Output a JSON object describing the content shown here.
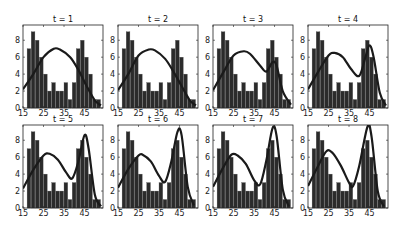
{
  "figure": {
    "layout": {
      "rows": 2,
      "cols": 4
    },
    "panels_pos": {
      "x0": [
        23,
        118,
        213,
        308
      ],
      "y0": [
        25,
        125
      ],
      "w": 80,
      "h": 83
    }
  },
  "chart_data": {
    "type": "bar",
    "xlim": [
      15,
      54
    ],
    "ylim": [
      0,
      9.8
    ],
    "xticks": [
      15,
      25,
      35,
      45
    ],
    "yticks": [
      0,
      2,
      4,
      6,
      8
    ],
    "histogram": {
      "bin_edges": [
        17,
        19,
        21,
        23,
        25,
        27,
        29,
        31,
        33,
        35,
        37,
        39,
        41,
        43,
        45,
        47,
        49,
        51,
        53
      ],
      "counts": [
        7,
        9,
        8,
        6,
        4,
        2,
        3,
        2,
        2,
        3,
        1,
        3,
        7,
        8,
        6,
        4,
        1,
        1
      ]
    },
    "panels": [
      {
        "title": "t = 1",
        "curve": [
          [
            15,
            2.2
          ],
          [
            20,
            4
          ],
          [
            25,
            6
          ],
          [
            30,
            7
          ],
          [
            33,
            6.9
          ],
          [
            38,
            6
          ],
          [
            42,
            4.5
          ],
          [
            46,
            2.6
          ],
          [
            50,
            0.9
          ],
          [
            53,
            0.3
          ]
        ]
      },
      {
        "title": "t = 2",
        "curve": [
          [
            15,
            2.1
          ],
          [
            20,
            4
          ],
          [
            25,
            6.2
          ],
          [
            30,
            6.9
          ],
          [
            33,
            6.8
          ],
          [
            38,
            5.8
          ],
          [
            42,
            4.3
          ],
          [
            46,
            2.6
          ],
          [
            50,
            0.9
          ],
          [
            53,
            0.3
          ]
        ]
      },
      {
        "title": "t = 3",
        "curve": [
          [
            15,
            2.1
          ],
          [
            20,
            4.2
          ],
          [
            25,
            6.2
          ],
          [
            30,
            6.7
          ],
          [
            33,
            6.4
          ],
          [
            38,
            5
          ],
          [
            41,
            4.3
          ],
          [
            44,
            5.4
          ],
          [
            46,
            5
          ],
          [
            49,
            2
          ],
          [
            53,
            0.4
          ]
        ]
      },
      {
        "title": "t = 4",
        "curve": [
          [
            15,
            2.2
          ],
          [
            20,
            4.3
          ],
          [
            25,
            6.2
          ],
          [
            28,
            6.5
          ],
          [
            32,
            6
          ],
          [
            36,
            4.6
          ],
          [
            40,
            3.8
          ],
          [
            43,
            6
          ],
          [
            45,
            7.4
          ],
          [
            47,
            6
          ],
          [
            50,
            1.8
          ],
          [
            53,
            0.3
          ]
        ]
      },
      {
        "title": "t = 5",
        "curve": [
          [
            15,
            2.3
          ],
          [
            20,
            4.5
          ],
          [
            25,
            6.2
          ],
          [
            28,
            6.4
          ],
          [
            32,
            5.7
          ],
          [
            36,
            4.2
          ],
          [
            39,
            3.5
          ],
          [
            42,
            5.5
          ],
          [
            45,
            8.6
          ],
          [
            47,
            7
          ],
          [
            50,
            1.6
          ],
          [
            53,
            0.2
          ]
        ]
      },
      {
        "title": "t = 6",
        "curve": [
          [
            15,
            2.4
          ],
          [
            20,
            4.6
          ],
          [
            25,
            6.2
          ],
          [
            27,
            6.3
          ],
          [
            31,
            5.5
          ],
          [
            35,
            3.8
          ],
          [
            38,
            3.1
          ],
          [
            41,
            5.5
          ],
          [
            44,
            9
          ],
          [
            46,
            8.6
          ],
          [
            49,
            2.5
          ],
          [
            52,
            0.3
          ]
        ]
      },
      {
        "title": "t = 7",
        "curve": [
          [
            15,
            2.5
          ],
          [
            20,
            4.8
          ],
          [
            24,
            6.3
          ],
          [
            27,
            6.2
          ],
          [
            31,
            5.2
          ],
          [
            35,
            3.3
          ],
          [
            38,
            2.8
          ],
          [
            41,
            5.6
          ],
          [
            44,
            9.4
          ],
          [
            46,
            8.5
          ],
          [
            49,
            2.2
          ],
          [
            52,
            0.2
          ]
        ]
      },
      {
        "title": "t = 8",
        "curve": [
          [
            15,
            2.6
          ],
          [
            20,
            5
          ],
          [
            24,
            6.7
          ],
          [
            27,
            6.5
          ],
          [
            31,
            5
          ],
          [
            35,
            3
          ],
          [
            37,
            2.6
          ],
          [
            40,
            5
          ],
          [
            44,
            9.6
          ],
          [
            46,
            8.4
          ],
          [
            49,
            2
          ],
          [
            52,
            0.2
          ]
        ]
      }
    ],
    "bar_color": "#2b2b2b",
    "curve_color": "#1a1a1a",
    "xlabel": "",
    "ylabel": "",
    "title": ""
  }
}
